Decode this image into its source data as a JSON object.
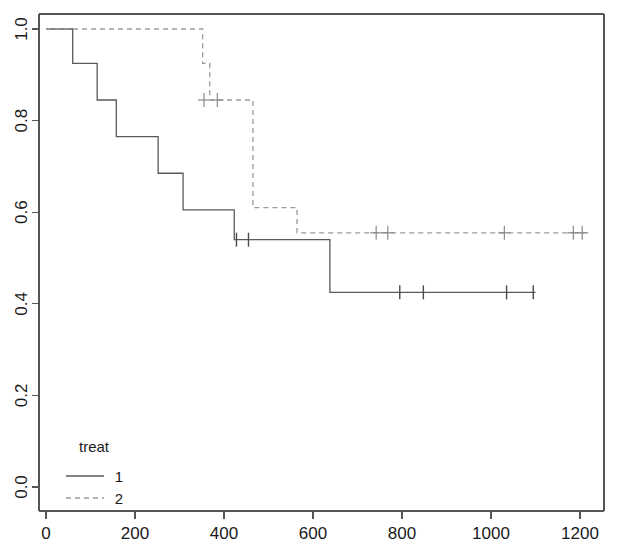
{
  "chart_data": {
    "type": "line",
    "subtype": "kaplan-meier-step",
    "title": "",
    "xlabel": "",
    "ylabel": "",
    "xlim": [
      0,
      1230
    ],
    "ylim": [
      0.0,
      1.0
    ],
    "grid": false,
    "x_ticks": [
      0,
      200,
      400,
      600,
      800,
      1000,
      1200
    ],
    "x_tick_labels": [
      "0",
      "200",
      "400",
      "600",
      "800",
      "1000",
      "1200"
    ],
    "y_ticks": [
      0.0,
      0.2,
      0.4,
      0.6,
      0.8,
      1.0
    ],
    "y_tick_labels": [
      "0.0",
      "0.2",
      "0.4",
      "0.6",
      "0.8",
      "1.0"
    ],
    "legend": {
      "title": "treat",
      "position": "bottom-left",
      "entries": [
        {
          "label": "1",
          "style": "solid",
          "color": "#5a5a5a"
        },
        {
          "label": "2",
          "style": "dashed",
          "color": "#9a9a9a"
        }
      ]
    },
    "series": [
      {
        "name": "1",
        "style": "solid",
        "color": "#5a5a5a",
        "steps": [
          {
            "t": 0,
            "s": 1.0
          },
          {
            "t": 60,
            "s": 0.925
          },
          {
            "t": 115,
            "s": 0.845
          },
          {
            "t": 158,
            "s": 0.765
          },
          {
            "t": 252,
            "s": 0.685
          },
          {
            "t": 308,
            "s": 0.605
          },
          {
            "t": 423,
            "s": 0.54
          },
          {
            "t": 638,
            "s": 0.425
          },
          {
            "t": 1100,
            "s": 0.425
          }
        ],
        "censored": [
          {
            "t": 428,
            "s": 0.54
          },
          {
            "t": 455,
            "s": 0.54
          },
          {
            "t": 795,
            "s": 0.425
          },
          {
            "t": 848,
            "s": 0.425
          },
          {
            "t": 1035,
            "s": 0.425
          },
          {
            "t": 1095,
            "s": 0.425
          }
        ]
      },
      {
        "name": "2",
        "style": "dashed",
        "color": "#9a9a9a",
        "steps": [
          {
            "t": 0,
            "s": 1.0
          },
          {
            "t": 352,
            "s": 0.925
          },
          {
            "t": 368,
            "s": 0.845
          },
          {
            "t": 465,
            "s": 0.61
          },
          {
            "t": 564,
            "s": 0.555
          },
          {
            "t": 1215,
            "s": 0.555
          }
        ],
        "censored": [
          {
            "t": 355,
            "s": 0.845
          },
          {
            "t": 385,
            "s": 0.845
          },
          {
            "t": 742,
            "s": 0.555
          },
          {
            "t": 768,
            "s": 0.555
          },
          {
            "t": 1030,
            "s": 0.555
          },
          {
            "t": 1185,
            "s": 0.555
          },
          {
            "t": 1205,
            "s": 0.555
          }
        ]
      }
    ]
  }
}
